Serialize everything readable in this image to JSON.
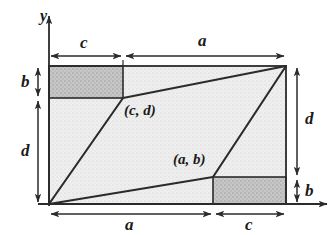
{
  "figure": {
    "axes": {
      "y_label": "y",
      "x_label": ""
    },
    "point_labels": {
      "upper": "(c, d)",
      "lower": "(a, b)"
    },
    "dimensions": {
      "top_left": "c",
      "top_right": "a",
      "bottom_left": "a",
      "bottom_right": "c",
      "left_upper": "b",
      "left_lower": "d",
      "right_upper": "d",
      "right_lower": "b"
    },
    "colors": {
      "stroke": "#2b2b2b",
      "fill_dark": "#c2c2c2",
      "fill_light": "#ececec",
      "background": "#ffffff",
      "text": "#1a1a1a"
    },
    "geometry": {
      "origin": [
        49,
        204
      ],
      "rect_right": 286,
      "rect_top": 66,
      "point_cd": [
        123,
        98
      ],
      "point_ab": [
        213,
        177
      ],
      "point_top_right": [
        286,
        66
      ]
    }
  }
}
